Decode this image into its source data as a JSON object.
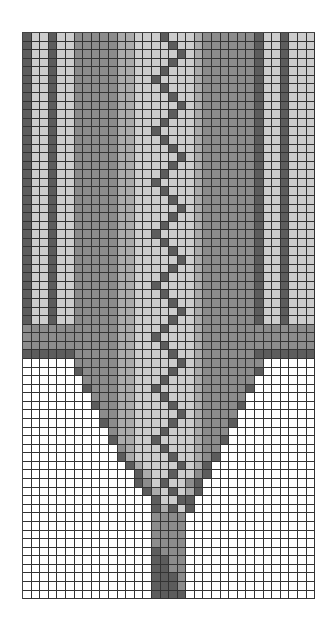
{
  "chart_data": {
    "type": "heatmap",
    "title": "",
    "columns": 34,
    "rows": 66,
    "palette": {
      "W": "#ffffff",
      "L": "#cdcdcd",
      "M": "#ababab",
      "G": "#8c8c8c",
      "D": "#5c5c5c"
    },
    "grid": [
      "DLLDLLGGGGGMMLLLDLLLMGGGGGGDLLDLLL",
      "DLLDLLGGGGGMMLLLLDLLMGGGGGGDLLDLLL",
      "DLLDLLGGGGGMMLLLLLDLMGGGGGGDLLDLLL",
      "DLLDLLGGGGGMMLLLLDLLMGGGGGGDLLDLLL",
      "DLLDLLGGGGGMMLLLDLLLMGGGGGGDLLDLLL",
      "DLLDLLGGGGGMMLLDLLLLMGGGGGGDLLDLLL",
      "DLLDLLGGGGGMMLLLDLLLMGGGGGGDLLDLLL",
      "DLLDLLGGGGGMMLLLLDLLMGGGGGGDLLDLLL",
      "DLLDLLGGGGGMMLLLLLDLMGGGGGGDLLDLLL",
      "DLLDLLGGGGGMMLLLLDLLMGGGGGGDLLDLLL",
      "DLLDLLGGGGGMMLLLDLLLMGGGGGGDLLDLLL",
      "DLLDLLGGGGGMMLLDLLLLMGGGGGGDLLDLLL",
      "DLLDLLGGGGGMMLLLDLLLMGGGGGGDLLDLLL",
      "DLLDLLGGGGGMMLLLLDLLMGGGGGGDLLDLLL",
      "DLLDLLGGGGGMMLLLLLDLMGGGGGGDLLDLLL",
      "DLLDLLGGGGGMMLLLLDLLMGGGGGGDLLDLLL",
      "DLLDLLGGGGGMMLLLDLLLMGGGGGGDLLDLLL",
      "DLLDLLGGGGGMMLLDLLLLMGGGGGGDLLDLLL",
      "DLLDLLGGGGGMMLLLDLLLMGGGGGGDLLDLLL",
      "DLLDLLGGGGGMMLLLLDLLMGGGGGGDLLDLLL",
      "DLLDLLGGGGGMMLLLLLDLMGGGGGGDLLDLLL",
      "DLLDLLGGGGGMMLLLLDLLMGGGGGGDLLDLLL",
      "DLLDLLGGGGGMMLLLDLLLMGGGGGGDLLDLLL",
      "DLLDLLGGGGGMMLLDLLLLMGGGGGGDLLDLLL",
      "DLLDLLGGGGGMMLLLDLLLMGGGGGGDLLDLLL",
      "DLLDLLGGGGGMMLLLLDLLMGGGGGGDLLDLLL",
      "DLLDLLGGGGGMMLLLLLDLMGGGGGGDLLDLLL",
      "DLLDLLGGGGGMMLLLLDLLMGGGGGGDLLDLLL",
      "DLLDLLGGGGGMMLLLDLLLMGGGGGGDLLDLLL",
      "DLLDLLGGGGGMMLLDLLLLMGGGGGGDLLDLLL",
      "DLLDLLGGGGGMMLLLDLLLMGGGGGGDLLDLLL",
      "DLLDLLGGGGGMMLLLLDLLMGGGGGGDLLDLLL",
      "DLLDLLGGGGGMMLLLLLDLMGGGGGGDLLDLLL",
      "DLLDLLGGGGGMMLLLLDLLMGGGGGGDLLDLLL",
      "GGGGGGGGGGGMMLLLDLLLMGGGGGGGGGGGGG",
      "GGGGGGGGGGGMMLLDLLLLMGGGGGGGGGGGGG",
      "GGGGGGGGGGGMMLLLDLLLMGGGGGGGGGGGGG",
      "DDDDDDGGGGGMMLLLLDLLMGGGGGGDDDDDDD",
      "WWWWWWGGGGGMMLLLLLDLMGGGGGGGWWWWWW",
      "WWWWWWDGGGGMMLLLLDLLMGGGGGGDWWWWWW",
      "WWWWWWWGGGGMMLLLDLLLMGGGGGGWWWWWWW",
      "WWWWWWWDGGGMMLLDLLLLMGGGGGDWWWWWWW",
      "WWWWWWWWGGGMMLLLDLLLMGGGGGWWWWWWWW",
      "WWWWWWWWDGGMMLLLLDLLMGGGGDWWWWWWWW",
      "WWWWWWWWWGGMMLLLLLDLMGGGGWWWWWWWWW",
      "WWWWWWWWWDGMMLLLLDLLMGGGDWWWWWWWWW",
      "WWWWWWWWWWGMMLLLDLLLMGGGWWWWWWWWWW",
      "WWWWWWWWWWDMMLLDLLLLMGGDWWWWWWWWWW",
      "WWWWWWWWWWWGMLLLDLLLMGGWWWWWWWWWWW",
      "WWWWWWWWWWWDMLLLLDLLMGDWWWWWWWWWWW",
      "WWWWWWWWWWWWDMLLLLDLMDWWWWWWWWWWWW",
      "WWWWWWWWWWWWWDMLLDLLGDWWWWWWWWWWWW",
      "WWWWWWWWWWWWWDGLDLLGDWWWWWWWWWWWWW",
      "WWWWWWWWWWWWWWDMLDLMDWWWWWWWWWWWWW",
      "WWWWWWWWWWWWWWWDLLDDWWWWWWWWWWWWWW",
      "WWWWWWWWWWWWWWWDMDLDWWWWWWWWWWWWWW",
      "WWWWWWWWWWWWWWWGGGGWWWWWWWWWWWWWWW",
      "WWWWWWWWWWWWWWWGGGGWWWWWWWWWWWWWWW",
      "WWWWWWWWWWWWWWWGGGGWWWWWWWWWWWWWWW",
      "WWWWWWWWWWWWWWWGGGGWWWWWWWWWWWWWWW",
      "WWWWWWWWWWWWWWWDGGGWWWWWWWWWWWWWWW",
      "WWWWWWWWWWWWWWWDDGGWWWWWWWWWWWWWWW",
      "WWWWWWWWWWWWWWWDDGGWWWWWWWWWWWWWWW",
      "WWWWWWWWWWWWWWWDDDGWWWWWWWWWWWWWWW",
      "WWWWWWWWWWWWWWWDDDGWWWWWWWWWWWWWWW",
      "WWWWWWWWWWWWWWWDDDDWWWWWWWWWWWWWWW"
    ]
  }
}
